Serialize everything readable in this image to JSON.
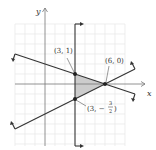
{
  "figure": {
    "type": "linear-inequality-graph",
    "axes": {
      "x_label": "x",
      "y_label": "y"
    },
    "grid": {
      "x_range": [
        -3,
        9
      ],
      "y_range": [
        -6,
        6
      ],
      "unit_px": 10
    },
    "shaded_region_color": "#cccccc",
    "line_color": "#333333",
    "grid_color": "#e6e6e6",
    "points": [
      {
        "label": "(3, 1)",
        "x": 3,
        "y": 1
      },
      {
        "label": "(6, 0)",
        "x": 6,
        "y": 0
      },
      {
        "label_prefix": "(3, −",
        "label_num": "3",
        "label_den": "2",
        "label_suffix": ")",
        "x": 3,
        "y": -1.5
      }
    ],
    "boundary_lines": [
      {
        "name": "x = 3",
        "arrows": "shade right"
      },
      {
        "name": "y = -x/3 + 2",
        "arrows": "shade below"
      },
      {
        "name": "y = x/2 - 3",
        "arrows": "shade above"
      }
    ]
  }
}
